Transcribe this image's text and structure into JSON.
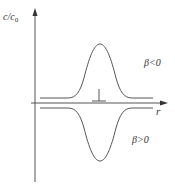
{
  "diagram": {
    "y_axis": {
      "label_main": "c/c",
      "label_sub": "0"
    },
    "x_axis": {
      "label": "r"
    },
    "annotations": {
      "upper_curve": "β<0",
      "lower_curve": "β>0"
    },
    "colors": {
      "line": "#555555",
      "text": "#333333",
      "background": "#ffffff"
    }
  }
}
